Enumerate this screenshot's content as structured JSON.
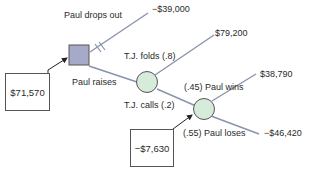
{
  "diagram": {
    "type": "decision-tree",
    "colors": {
      "branch": "#8a93ad",
      "decision_fill": "#a7a9c8",
      "chance_fill": "#d6ebd9",
      "node_stroke": "#555555",
      "arrow": "#222222"
    },
    "nodes": {
      "decision": {
        "id": "paul-decision",
        "shape": "square"
      },
      "chance1": {
        "id": "tj-response",
        "shape": "circle"
      },
      "chance2": {
        "id": "showdown",
        "shape": "circle"
      }
    },
    "branches": {
      "drop_out": {
        "label": "Paul drops out",
        "payoff": "−$39,000",
        "pruned": true
      },
      "raise": {
        "label": "Paul raises"
      },
      "tj_folds": {
        "label": "T.J. folds (.8)",
        "payoff": "$79,200"
      },
      "tj_calls": {
        "label": "T.J. calls (.2)"
      },
      "paul_wins": {
        "label": "(.45) Paul wins",
        "payoff": "$38,790"
      },
      "paul_loses": {
        "label": "(.55) Paul loses",
        "payoff": "−$46,420"
      }
    },
    "expected_values": {
      "decision_ev": "$71,570",
      "showdown_ev": "−$7,630"
    }
  }
}
